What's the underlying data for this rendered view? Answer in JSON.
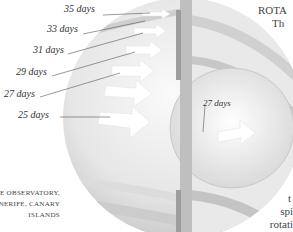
{
  "diagram": {
    "title_fragment_top": [
      "ROTA",
      "Th"
    ],
    "title_fragment_bottom": [
      "t",
      "spi",
      "rotati"
    ],
    "caption": [
      "E OBSERVATORY,",
      "NERIFE, CANARY",
      "ISLANDS"
    ],
    "surface_labels": [
      {
        "text": "35 days",
        "x": 64,
        "y": 10
      },
      {
        "text": "33 days",
        "x": 47,
        "y": 29
      },
      {
        "text": "31 days",
        "x": 33,
        "y": 49
      },
      {
        "text": "29 days",
        "x": 16,
        "y": 70
      },
      {
        "text": "27 days",
        "x": 5,
        "y": 91
      },
      {
        "text": "25 days",
        "x": 20,
        "y": 112
      }
    ],
    "core_label": {
      "text": "27 days",
      "x": 197,
      "y": 97
    },
    "colors": {
      "sphere_light": "#f2f2f2",
      "sphere_mid": "#d9d9d9",
      "sphere_dark": "#b5b5b5",
      "leader_line": "#555555",
      "text": "#333333"
    }
  }
}
